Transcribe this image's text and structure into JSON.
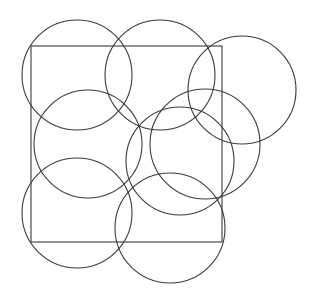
{
  "canvas": {
    "width": 312,
    "height": 296,
    "background_color": "#ffffff"
  },
  "figure": {
    "stroke_color": "#3b3b3b",
    "stroke_width": 1.1,
    "fill": "none"
  },
  "chart_data": {
    "type": "diagram",
    "units": "pixels",
    "coordinate_origin": "top-left",
    "square": {
      "name": "covered-square",
      "x": 31,
      "y": 46,
      "width": 191,
      "height": 196,
      "left": 31,
      "top": 46,
      "right": 222,
      "bottom": 242,
      "stroke": "#3b3b3b"
    },
    "circle_radius": 55,
    "circle_count": 8,
    "circles": [
      {
        "name": "circle-top-left",
        "cx": 77,
        "cy": 75,
        "r": 55
      },
      {
        "name": "circle-top-middle",
        "cx": 160,
        "cy": 75,
        "r": 55
      },
      {
        "name": "circle-top-right",
        "cx": 242,
        "cy": 90,
        "r": 54
      },
      {
        "name": "circle-mid-left",
        "cx": 88,
        "cy": 144,
        "r": 54
      },
      {
        "name": "circle-mid-right",
        "cx": 180,
        "cy": 161,
        "r": 54
      },
      {
        "name": "circle-bottom-left",
        "cx": 77,
        "cy": 213,
        "r": 55
      },
      {
        "name": "circle-bottom-mid",
        "cx": 170,
        "cy": 228,
        "r": 55
      },
      {
        "name": "circle-right-edge",
        "cx": 205,
        "cy": 144,
        "r": 55
      }
    ],
    "stroke_color": "#3b3b3b",
    "grid": false,
    "legend": null,
    "axis_labels": null
  }
}
